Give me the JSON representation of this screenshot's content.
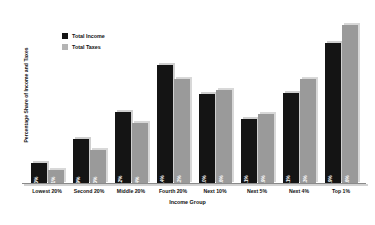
{
  "chart_data": {
    "type": "bar",
    "title": "",
    "xlabel": "Income Group",
    "ylabel": "Percentage Share of Income and Taxes",
    "categories": [
      "Lowest 20%",
      "Second 20%",
      "Middle 20%",
      "Fourth 20%",
      "Next 10%",
      "Next 5%",
      "Next 4%",
      "Top 1%"
    ],
    "ylim": [
      0,
      26
    ],
    "grid": false,
    "legend_position": "top-left",
    "series": [
      {
        "name": "Total Income",
        "color": "#141414",
        "values": [
          3.3,
          6.9,
          11.2,
          18.4,
          14.0,
          10.1,
          14.1,
          21.9
        ],
        "labels": [
          "3.3%",
          "6.9%",
          "11.2%",
          "18.4%",
          "14.0%",
          "10.1%",
          "14.1%",
          "21.9%"
        ]
      },
      {
        "name": "Total Taxes",
        "color": "#9a9a9a",
        "values": [
          2.1,
          5.3,
          9.4,
          16.2,
          14.6,
          10.9,
          16.3,
          24.6
        ],
        "labels": [
          "2.1%",
          "5.3%",
          "9.4%",
          "16.2%",
          "14.6%",
          "10.9%",
          "16.3%",
          "24.6%"
        ]
      }
    ]
  },
  "legend": {
    "items": [
      {
        "label": "Total Income"
      },
      {
        "label": "Total Taxes"
      }
    ]
  }
}
